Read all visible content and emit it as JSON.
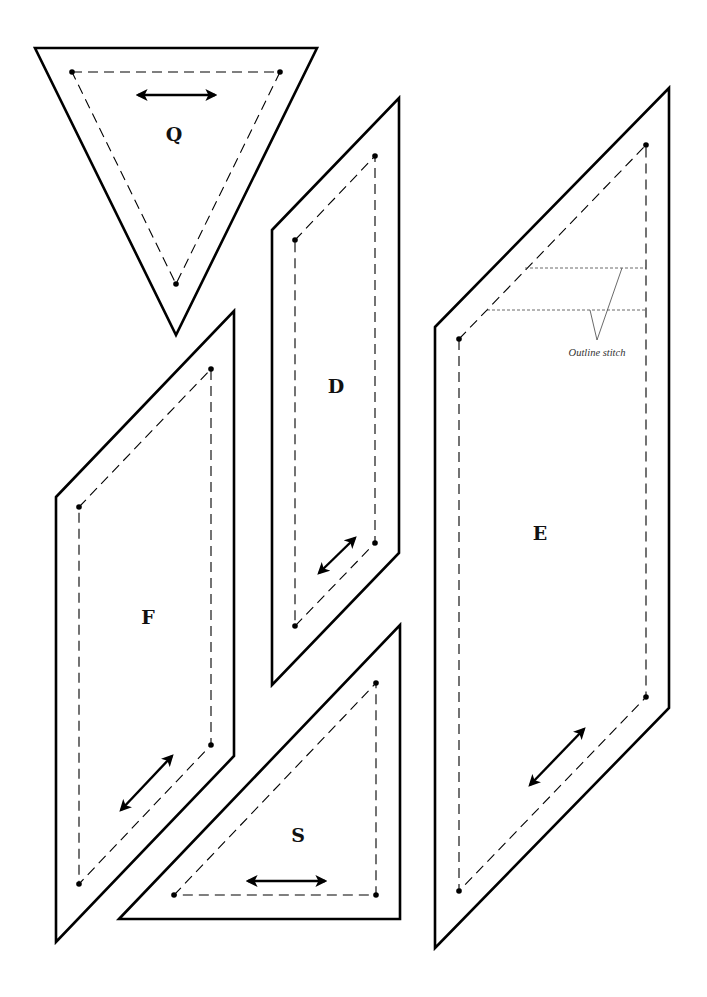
{
  "diagram": {
    "background": "#ffffff",
    "line_color": "#000000",
    "pieces": [
      {
        "id": "Q",
        "label": "Q",
        "label_pos": [
          174,
          136
        ],
        "outline": [
          [
            35,
            48
          ],
          [
            317,
            48
          ],
          [
            176,
            335
          ]
        ],
        "seam": [
          [
            72,
            72
          ],
          [
            280,
            72
          ],
          [
            176,
            284
          ]
        ],
        "grain_arrow": [
          [
            138,
            95
          ],
          [
            215,
            95
          ]
        ]
      },
      {
        "id": "D",
        "label": "D",
        "label_pos": [
          336,
          388
        ],
        "outline": [
          [
            272,
            230
          ],
          [
            399,
            98
          ],
          [
            399,
            553
          ],
          [
            272,
            685
          ]
        ],
        "seam": [
          [
            295,
            240
          ],
          [
            375,
            156
          ],
          [
            375,
            543
          ],
          [
            295,
            626
          ]
        ],
        "grain_arrow": [
          [
            319,
            573
          ],
          [
            355,
            538
          ]
        ]
      },
      {
        "id": "E",
        "label": "E",
        "label_pos": [
          540,
          535
        ],
        "outline": [
          [
            435,
            327
          ],
          [
            669,
            88
          ],
          [
            669,
            708
          ],
          [
            435,
            948
          ]
        ],
        "seam": [
          [
            459,
            339
          ],
          [
            646,
            145
          ],
          [
            646,
            697
          ],
          [
            459,
            891
          ]
        ],
        "grain_arrow": [
          [
            530,
            785
          ],
          [
            584,
            729
          ]
        ]
      },
      {
        "id": "F",
        "label": "F",
        "label_pos": [
          148,
          619
        ],
        "outline": [
          [
            56,
            497
          ],
          [
            234,
            311
          ],
          [
            234,
            756
          ],
          [
            56,
            942
          ]
        ],
        "seam": [
          [
            79,
            507
          ],
          [
            211,
            369
          ],
          [
            211,
            745
          ],
          [
            79,
            884
          ]
        ],
        "grain_arrow": [
          [
            121,
            810
          ],
          [
            172,
            756
          ]
        ]
      },
      {
        "id": "S",
        "label": "S",
        "label_pos": [
          298,
          837
        ],
        "outline": [
          [
            119,
            919
          ],
          [
            400,
            625
          ],
          [
            400,
            919
          ]
        ],
        "seam": [
          [
            174,
            895
          ],
          [
            376,
            683
          ],
          [
            376,
            895
          ]
        ],
        "grain_arrow": [
          [
            248,
            881
          ],
          [
            325,
            881
          ]
        ]
      }
    ],
    "annotation": {
      "text": "Outline stitch",
      "text_pos": [
        597,
        356
      ],
      "stitch_lines": [
        [
          [
            525,
            268
          ],
          [
            646,
            268
          ]
        ],
        [
          [
            487,
            310
          ],
          [
            646,
            310
          ]
        ]
      ],
      "leaders": [
        [
          [
            622,
            268
          ],
          [
            597,
            340
          ]
        ],
        [
          [
            590,
            310
          ],
          [
            597,
            340
          ]
        ]
      ]
    }
  }
}
